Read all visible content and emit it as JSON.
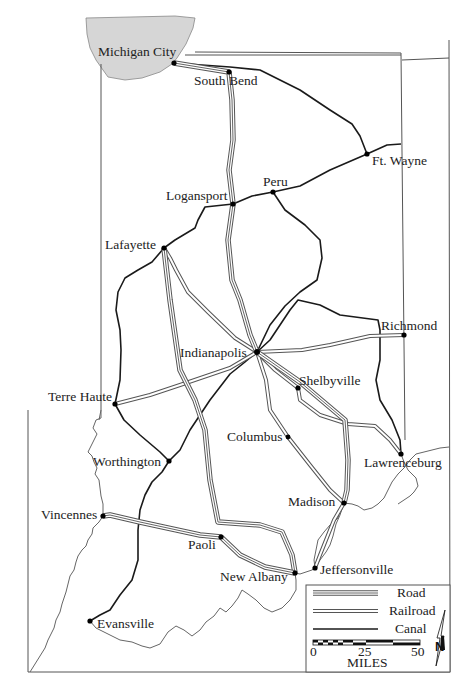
{
  "map": {
    "title": "Indiana transportation: roads, railroads and canals",
    "lake_label": "",
    "colors": {
      "lake": "#d6d6d6",
      "line": "#1a1a1a",
      "railroad": "#555555",
      "border": "#555555"
    },
    "cities": [
      {
        "name": "Michigan City",
        "x": 174,
        "y": 63
      },
      {
        "name": "South Bend",
        "x": 229,
        "y": 72
      },
      {
        "name": "Ft. Wayne",
        "x": 367,
        "y": 154
      },
      {
        "name": "Peru",
        "x": 273,
        "y": 192
      },
      {
        "name": "Logansport",
        "x": 233,
        "y": 204
      },
      {
        "name": "Lafayette",
        "x": 164,
        "y": 248
      },
      {
        "name": "Richmond",
        "x": 404,
        "y": 335
      },
      {
        "name": "Indianapolis",
        "x": 257,
        "y": 352
      },
      {
        "name": "Shelbyville",
        "x": 298,
        "y": 388
      },
      {
        "name": "Terre Haute",
        "x": 115,
        "y": 404
      },
      {
        "name": "Columbus",
        "x": 288,
        "y": 437
      },
      {
        "name": "Lawrenceburg",
        "x": 401,
        "y": 454
      },
      {
        "name": "Worthington",
        "x": 169,
        "y": 461
      },
      {
        "name": "Madison",
        "x": 344,
        "y": 503
      },
      {
        "name": "Vincennes",
        "x": 103,
        "y": 516
      },
      {
        "name": "Paoli",
        "x": 221,
        "y": 537
      },
      {
        "name": "New Albany",
        "x": 295,
        "y": 573
      },
      {
        "name": "Jeffersonville",
        "x": 315,
        "y": 568
      },
      {
        "name": "Evansville",
        "x": 90,
        "y": 621
      }
    ],
    "legend": {
      "road_label": "Road",
      "railroad_label": "Railroad",
      "canal_label": "Canal",
      "scale_ticks": [
        "0",
        "25",
        "50"
      ],
      "scale_unit": "MILES",
      "north_label": "N"
    }
  }
}
